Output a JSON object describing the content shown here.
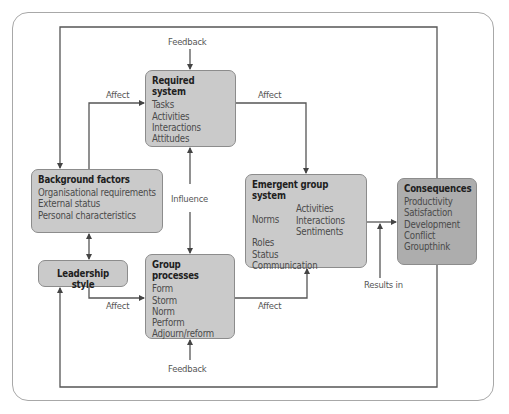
{
  "diagram": {
    "boxes": {
      "required": {
        "title": "Required system",
        "items": [
          "Tasks",
          "Activities",
          "Interactions",
          "Attitudes"
        ]
      },
      "background": {
        "title": "Background factors",
        "items": [
          "Organisational requirements",
          "External status",
          "Personal characteristics"
        ]
      },
      "leadership": {
        "title": "Leadership style"
      },
      "group": {
        "title": "Group processes",
        "items": [
          "Form",
          "Storm",
          "Norm",
          "Perform",
          "Adjourn/reform"
        ]
      },
      "emergent": {
        "title": "Emergent group system",
        "norms_label": "Norms",
        "norms_items": [
          "Activities",
          "Interactions",
          "Sentiments"
        ],
        "items": [
          "Roles",
          "Status",
          "Communication"
        ]
      },
      "consequences": {
        "title": "Consequences",
        "items": [
          "Productivity",
          "Satisfaction",
          "Development",
          "Conflict",
          "Groupthink"
        ]
      }
    },
    "labels": {
      "feedback_top": "Feedback",
      "feedback_bottom": "Feedback",
      "affect_bg_req": "Affect",
      "affect_req_em": "Affect",
      "influence": "Influence",
      "affect_lead_group": "Affect",
      "affect_group_em": "Affect",
      "results_in": "Results in"
    },
    "colors": {
      "box": "#cacaca",
      "box_dark": "#adadad",
      "line": "#555555"
    }
  }
}
